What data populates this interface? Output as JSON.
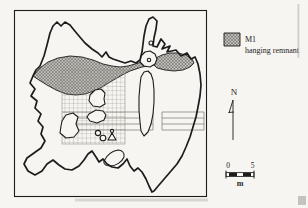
{
  "figure": {
    "kind": "site-plan-map",
    "legend": {
      "code": "M1",
      "label": "hanging remnant"
    },
    "north_arrow": {
      "label": "N"
    },
    "scale_bar": {
      "min": "0",
      "max": "5",
      "unit": "m"
    },
    "colors": {
      "paper": "#f6f5f1",
      "ink": "#1c1c1c",
      "hatch_fill": "#c9c8c2",
      "hatch_line": "#4f4f4b",
      "grid_line": "#8f8f88"
    }
  }
}
